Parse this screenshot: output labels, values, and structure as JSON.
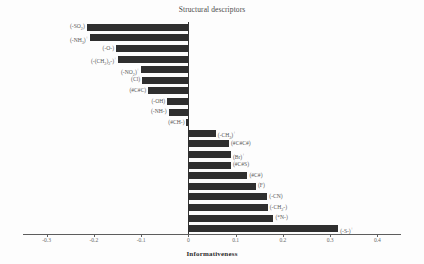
{
  "chart_data": {
    "type": "bar",
    "orientation": "horizontal",
    "title": "Structural descriptors",
    "xlabel": "Informativeness",
    "ylabel": "",
    "xlim": [
      -0.35,
      0.45
    ],
    "grid": false,
    "legend": null,
    "tick_labels": [
      "-0.3",
      "-0.2",
      "-0.1",
      "0",
      "0.1",
      "0.2",
      "0.3",
      "0.4"
    ],
    "tick_values": [
      -0.3,
      -0.2,
      -0.1,
      0,
      0.1,
      0.2,
      0.3,
      0.4
    ],
    "categories": [
      "(-SO2)",
      "(-NH3)+",
      "(-O-)",
      "(-(CH2)2-)+",
      "(-NO2)+",
      "(Cl)",
      "(#C#C)",
      "(-OH)",
      "(-NH-)",
      "(#CH-)",
      "(-CH3)+",
      "(#C#C#)",
      "(Br)+",
      "(#C#S)",
      "(#C#)",
      "(F)",
      "(-CN)",
      "(-CH2-)",
      "(*N-)",
      "(-S-)+"
    ],
    "values": [
      -0.215,
      -0.208,
      -0.153,
      -0.148,
      -0.1,
      -0.098,
      -0.085,
      -0.045,
      -0.042,
      -0.004,
      0.058,
      0.086,
      0.09,
      0.09,
      0.125,
      0.143,
      0.167,
      0.168,
      0.18,
      0.317
    ],
    "bar_color": "#2f2f2f"
  },
  "labels_html": [
    "(-SO<sub>2</sub>)",
    "(-NH<sub>3</sub>)<sup>+</sup>",
    "(-O-)",
    "(-(CH<sub>2</sub>)<sub>2</sub>-)<sup>+</sup>",
    "(-NO<sub>2</sub>)<sup>+</sup>",
    "(Cl)",
    "(#C#C)",
    "(-OH)",
    "(-NH-)",
    "(#CH-)",
    "(-CH<sub>3</sub>)<sup>+</sup>",
    "(#C#C#)",
    "(Br)<sup>+</sup>",
    "(#C#S)",
    "(#C#)",
    "(F)",
    "(-CN)",
    "(-CH<sub>2</sub>-)",
    "(*N-)",
    "(-S-)<sup>+</sup>"
  ]
}
